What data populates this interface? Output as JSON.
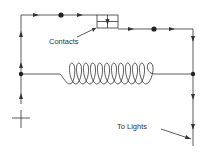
{
  "diagram": {
    "type": "electrical-circuit",
    "labels": {
      "contacts": "Contacts",
      "to_lights": "To Lights"
    },
    "symbols": {
      "positive_terminal": "+",
      "coil": "solenoid-coil",
      "contacts": "relay-contacts"
    },
    "colors": {
      "line": "#333333",
      "background": "#ffffff"
    }
  }
}
